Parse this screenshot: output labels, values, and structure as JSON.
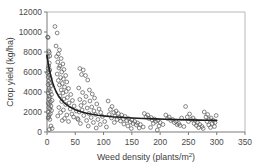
{
  "figure": {
    "background_color": "#ffffff",
    "point_color": "#5d5d5d",
    "curve_color": "#1d1d1d",
    "axis_color": "#7a7a7a"
  },
  "chart_data": {
    "type": "scatter",
    "title": "",
    "xlabel": "Weed density (plants/m2)",
    "xlabel_base": "Weed density (plants/m",
    "xlabel_sup": "2",
    "xlabel_close": ")",
    "ylabel": "Crop yield (kg/ha)",
    "xlim": [
      0,
      350
    ],
    "ylim": [
      0,
      12000
    ],
    "xticks": [
      0,
      50,
      100,
      150,
      200,
      250,
      300,
      350
    ],
    "xtick_labels": [
      "0",
      "50",
      "100",
      "150",
      "200",
      "250",
      "300",
      "350"
    ],
    "yticks": [
      0,
      2000,
      4000,
      6000,
      8000,
      10000,
      12000
    ],
    "ytick_labels": [
      "0",
      "2000",
      "4000",
      "6000",
      "8000",
      "10000",
      "12000"
    ],
    "grid": false,
    "legend": null,
    "marker": "open-circle",
    "series": [
      {
        "name": "observations",
        "points": [
          [
            1,
            9500
          ],
          [
            2,
            9450
          ],
          [
            3,
            8100
          ],
          [
            4,
            7950
          ],
          [
            5,
            7600
          ],
          [
            2,
            7500
          ],
          [
            4,
            6900
          ],
          [
            3,
            6600
          ],
          [
            2,
            6350
          ],
          [
            5,
            6200
          ],
          [
            3,
            6050
          ],
          [
            1,
            5900
          ],
          [
            4,
            5700
          ],
          [
            2,
            5500
          ],
          [
            6,
            5350
          ],
          [
            3,
            5100
          ],
          [
            5,
            4900
          ],
          [
            2,
            4750
          ],
          [
            7,
            4600
          ],
          [
            4,
            4400
          ],
          [
            3,
            4200
          ],
          [
            6,
            4050
          ],
          [
            2,
            3900
          ],
          [
            8,
            3750
          ],
          [
            4,
            3600
          ],
          [
            5,
            3450
          ],
          [
            3,
            3300
          ],
          [
            9,
            3150
          ],
          [
            6,
            3000
          ],
          [
            2,
            2900
          ],
          [
            4,
            2750
          ],
          [
            7,
            2600
          ],
          [
            3,
            2450
          ],
          [
            5,
            2300
          ],
          [
            8,
            2150
          ],
          [
            2,
            2000
          ],
          [
            6,
            1850
          ],
          [
            4,
            1700
          ],
          [
            3,
            1500
          ],
          [
            2,
            1400
          ],
          [
            5,
            1250
          ],
          [
            7,
            600
          ],
          [
            9,
            350
          ],
          [
            4,
            250
          ],
          [
            14,
            10550
          ],
          [
            18,
            9900
          ],
          [
            16,
            8600
          ],
          [
            22,
            8200
          ],
          [
            20,
            7800
          ],
          [
            17,
            7550
          ],
          [
            25,
            7350
          ],
          [
            19,
            7000
          ],
          [
            28,
            6800
          ],
          [
            23,
            6600
          ],
          [
            21,
            6400
          ],
          [
            30,
            6250
          ],
          [
            26,
            6000
          ],
          [
            18,
            5800
          ],
          [
            33,
            5650
          ],
          [
            24,
            5450
          ],
          [
            29,
            5300
          ],
          [
            20,
            5150
          ],
          [
            35,
            5000
          ],
          [
            27,
            4850
          ],
          [
            22,
            4700
          ],
          [
            31,
            4500
          ],
          [
            38,
            4350
          ],
          [
            25,
            4200
          ],
          [
            34,
            4050
          ],
          [
            28,
            3900
          ],
          [
            42,
            3750
          ],
          [
            23,
            3600
          ],
          [
            36,
            3450
          ],
          [
            30,
            3300
          ],
          [
            45,
            3150
          ],
          [
            26,
            3050
          ],
          [
            39,
            2900
          ],
          [
            33,
            2750
          ],
          [
            48,
            2600
          ],
          [
            21,
            2450
          ],
          [
            41,
            2300
          ],
          [
            29,
            2200
          ],
          [
            52,
            2100
          ],
          [
            24,
            1950
          ],
          [
            44,
            1800
          ],
          [
            35,
            1700
          ],
          [
            19,
            1600
          ],
          [
            47,
            1500
          ],
          [
            31,
            1350
          ],
          [
            55,
            1250
          ],
          [
            27,
            1150
          ],
          [
            38,
            1050
          ],
          [
            58,
            6350
          ],
          [
            64,
            6200
          ],
          [
            61,
            5750
          ],
          [
            68,
            5650
          ],
          [
            72,
            5200
          ],
          [
            56,
            4400
          ],
          [
            75,
            4200
          ],
          [
            63,
            3950
          ],
          [
            80,
            3800
          ],
          [
            69,
            3550
          ],
          [
            84,
            3400
          ],
          [
            58,
            3250
          ],
          [
            76,
            3100
          ],
          [
            66,
            2950
          ],
          [
            88,
            2800
          ],
          [
            60,
            2650
          ],
          [
            79,
            2500
          ],
          [
            71,
            2400
          ],
          [
            92,
            2300
          ],
          [
            62,
            2200
          ],
          [
            83,
            2100
          ],
          [
            57,
            2000
          ],
          [
            95,
            1950
          ],
          [
            74,
            1850
          ],
          [
            86,
            1750
          ],
          [
            65,
            1650
          ],
          [
            98,
            1550
          ],
          [
            78,
            1450
          ],
          [
            54,
            1350
          ],
          [
            90,
            1250
          ],
          [
            70,
            1150
          ],
          [
            102,
            1050
          ],
          [
            82,
            950
          ],
          [
            59,
            850
          ],
          [
            94,
            750
          ],
          [
            73,
            600
          ],
          [
            105,
            500
          ],
          [
            87,
            400
          ],
          [
            108,
            3100
          ],
          [
            115,
            2550
          ],
          [
            112,
            2250
          ],
          [
            122,
            2100
          ],
          [
            118,
            1950
          ],
          [
            126,
            1850
          ],
          [
            110,
            1750
          ],
          [
            132,
            1700
          ],
          [
            120,
            1600
          ],
          [
            138,
            1550
          ],
          [
            128,
            1450
          ],
          [
            114,
            1400
          ],
          [
            144,
            1350
          ],
          [
            135,
            1300
          ],
          [
            124,
            1250
          ],
          [
            150,
            1200
          ],
          [
            141,
            1150
          ],
          [
            130,
            1100
          ],
          [
            155,
            1050
          ],
          [
            147,
            1000
          ],
          [
            119,
            950
          ],
          [
            160,
            900
          ],
          [
            152,
            850
          ],
          [
            136,
            800
          ],
          [
            165,
            750
          ],
          [
            158,
            700
          ],
          [
            143,
            600
          ],
          [
            170,
            500
          ],
          [
            163,
            400
          ],
          [
            149,
            350
          ],
          [
            172,
            1850
          ],
          [
            178,
            1700
          ],
          [
            175,
            1500
          ],
          [
            184,
            1450
          ],
          [
            180,
            1350
          ],
          [
            190,
            1300
          ],
          [
            186,
            1200
          ],
          [
            196,
            1150
          ],
          [
            192,
            1050
          ],
          [
            200,
            950
          ],
          [
            188,
            850
          ],
          [
            205,
            750
          ],
          [
            198,
            600
          ],
          [
            183,
            450
          ],
          [
            195,
            200
          ],
          [
            210,
            1700
          ],
          [
            216,
            1500
          ],
          [
            213,
            1350
          ],
          [
            222,
            1250
          ],
          [
            219,
            1150
          ],
          [
            228,
            1050
          ],
          [
            225,
            950
          ],
          [
            233,
            850
          ],
          [
            230,
            750
          ],
          [
            238,
            1400
          ],
          [
            235,
            650
          ],
          [
            242,
            550
          ],
          [
            245,
            2550
          ],
          [
            252,
            1800
          ],
          [
            248,
            1500
          ],
          [
            258,
            1400
          ],
          [
            255,
            1250
          ],
          [
            262,
            1150
          ],
          [
            250,
            1050
          ],
          [
            266,
            950
          ],
          [
            260,
            850
          ],
          [
            270,
            750
          ],
          [
            264,
            650
          ],
          [
            274,
            550
          ],
          [
            268,
            450
          ],
          [
            278,
            2000
          ],
          [
            284,
            1750
          ],
          [
            281,
            1500
          ],
          [
            290,
            1400
          ],
          [
            287,
            1250
          ],
          [
            294,
            1150
          ],
          [
            283,
            1050
          ],
          [
            297,
            950
          ],
          [
            292,
            850
          ],
          [
            286,
            700
          ],
          [
            299,
            1650
          ],
          [
            296,
            550
          ],
          [
            289,
            450
          ],
          [
            276,
            350
          ]
        ]
      }
    ],
    "fit_curve": {
      "name": "fitted-decay-curve",
      "description": "rectangular hyperbola yield decline",
      "model": "y = 1050 + 6650 / (1 + x / 16)",
      "y_at_x0": 7700,
      "asymptote": 1080,
      "points": [
        [
          0,
          7700
        ],
        [
          2,
          6920
        ],
        [
          4,
          6300
        ],
        [
          6,
          5760
        ],
        [
          8,
          5310
        ],
        [
          10,
          4920
        ],
        [
          13,
          4440
        ],
        [
          16,
          4050
        ],
        [
          20,
          3640
        ],
        [
          25,
          3250
        ],
        [
          30,
          2950
        ],
        [
          35,
          2710
        ],
        [
          40,
          2520
        ],
        [
          50,
          2230
        ],
        [
          60,
          2030
        ],
        [
          70,
          1880
        ],
        [
          80,
          1770
        ],
        [
          90,
          1680
        ],
        [
          100,
          1610
        ],
        [
          115,
          1530
        ],
        [
          130,
          1470
        ],
        [
          150,
          1400
        ],
        [
          170,
          1350
        ],
        [
          190,
          1310
        ],
        [
          210,
          1270
        ],
        [
          230,
          1240
        ],
        [
          250,
          1210
        ],
        [
          270,
          1190
        ],
        [
          285,
          1170
        ],
        [
          300,
          1160
        ]
      ]
    }
  }
}
